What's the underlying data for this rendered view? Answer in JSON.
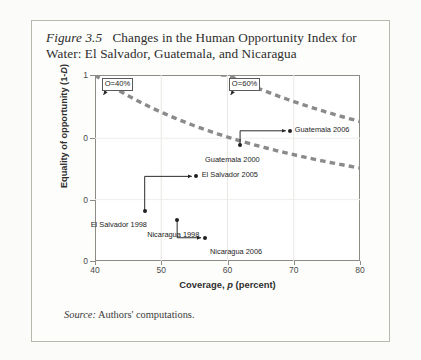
{
  "figure": {
    "number": "Figure 3.5",
    "title": "Changes in the Human Opportunity Index for Water: El Salvador, Guatemala, and Nicaragua",
    "source_prefix": "Source:",
    "source_text": "Authors' computations."
  },
  "chart_data": {
    "type": "scatter",
    "title": "Changes in the Human Opportunity Index for Water: El Salvador, Guatemala, and Nicaragua",
    "xlabel_prefix": "Coverage,",
    "xlabel_italic": "p",
    "xlabel_suffix": "(percent)",
    "ylabel_prefix": "Equality of opportunity (1-",
    "ylabel_italic": "D",
    "ylabel_suffix": ")",
    "xlim": [
      40,
      80
    ],
    "ylim": [
      0,
      1
    ],
    "xticks": [
      40,
      50,
      60,
      70,
      80
    ],
    "xtick_labels": [
      "40",
      "50",
      "60",
      "70",
      "80"
    ],
    "yticks": [
      0,
      0.33,
      0.66,
      1
    ],
    "ytick_labels": [
      "0",
      "0",
      "0",
      "1"
    ],
    "grid": true,
    "legend": "none",
    "points": [
      {
        "name": "El Salvador 1998",
        "x": 47.5,
        "y": 0.27,
        "label_dx": -54,
        "label_dy": 9
      },
      {
        "name": "El Salvador 2005",
        "x": 55.2,
        "y": 0.455,
        "label_dx": 6,
        "label_dy": -6
      },
      {
        "name": "Nicaragua 1998",
        "x": 52.4,
        "y": 0.222,
        "label_dx": -30,
        "label_dy": 10
      },
      {
        "name": "Nicaragua 2006",
        "x": 56.6,
        "y": 0.125,
        "label_dx": 5,
        "label_dy": 9
      },
      {
        "name": "Guatemala 2000",
        "x": 61.9,
        "y": 0.625,
        "label_dx": -35,
        "label_dy": 10
      },
      {
        "name": "Guatemala 2006",
        "x": 69.4,
        "y": 0.7,
        "label_dx": 5,
        "label_dy": -6
      }
    ],
    "arrows": [
      {
        "from": "El Salvador 1998",
        "to": "El Salvador 2005"
      },
      {
        "from": "Nicaragua 1998",
        "to": "Nicaragua 2006"
      },
      {
        "from": "Guatemala 2000",
        "to": "Guatemala 2006"
      }
    ],
    "iso_curves": [
      {
        "label": "O=40%",
        "level": 0.4,
        "box_x": 41.0,
        "box_y": 0.985
      },
      {
        "label": "O=60%",
        "level": 0.6,
        "box_x": 60.2,
        "box_y": 0.985
      }
    ],
    "curve_color": "#8a8a8a",
    "point_color": "#22211f",
    "annotations": [
      "O=40%",
      "O=60%"
    ]
  }
}
